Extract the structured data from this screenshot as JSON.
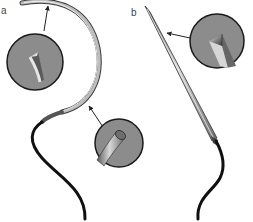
{
  "panels": [
    {
      "label": "a",
      "subject": "curved-needle",
      "callouts": [
        "cutting-tip-detail",
        "round-body-cross-section"
      ]
    },
    {
      "label": "b",
      "subject": "straight-needle",
      "callouts": [
        "cutting-tip-detail"
      ]
    }
  ],
  "colors": {
    "background": "#ffffff",
    "magnifier_fill": "#8c8c8c",
    "magnifier_stroke": "#1a1a1a",
    "needle_body": "#9a9a9a",
    "needle_highlight": "#d9d9d9",
    "suture": "#111111",
    "arrow": "#222222"
  }
}
